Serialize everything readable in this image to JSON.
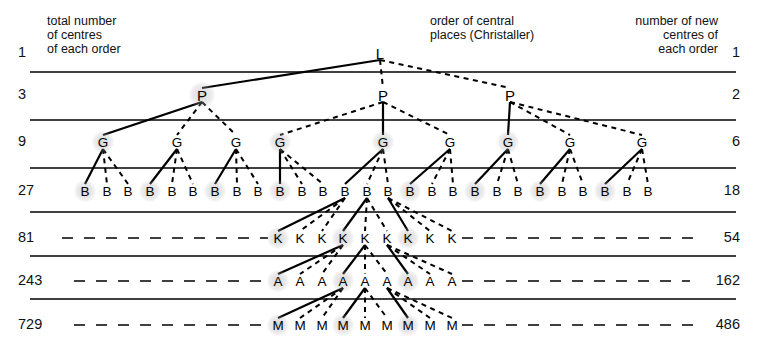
{
  "header": {
    "left_label": "total number\nof centres\nof each order",
    "mid_label": "order of central\nplaces (Christaller)",
    "right_label": "number of new\ncentres of\neach order"
  },
  "colors": {
    "ink": "#111111",
    "rule": "#000000",
    "halo": "#b0b0b0"
  },
  "rows": [
    {
      "symbol": "L",
      "total": "1",
      "new": "1",
      "y": 53,
      "rule_y": 72,
      "count": 1
    },
    {
      "symbol": "P",
      "total": "3",
      "new": "2",
      "y": 95,
      "rule_y": 120,
      "count": 3
    },
    {
      "symbol": "G",
      "total": "9",
      "new": "6",
      "y": 142,
      "rule_y": 168,
      "count": 9
    },
    {
      "symbol": "B",
      "total": "27",
      "new": "18",
      "y": 191,
      "rule_y": 212,
      "count": 27
    },
    {
      "symbol": "K",
      "total": "81",
      "new": "54",
      "y": 238,
      "rule_y": 256,
      "count": 81
    },
    {
      "symbol": "A",
      "total": "243",
      "new": "162",
      "y": 281,
      "rule_y": 299,
      "count": 243
    },
    {
      "symbol": "M",
      "total": "729",
      "new": "486",
      "y": 325,
      "rule_y": null,
      "count": 729
    }
  ],
  "nodes": {
    "L": [
      {
        "x": 380,
        "halo": false
      }
    ],
    "P": [
      {
        "x": 202,
        "halo": true
      },
      {
        "x": 383,
        "halo": false
      },
      {
        "x": 510,
        "halo": false
      }
    ],
    "G": [
      {
        "x": 103,
        "halo": true
      },
      {
        "x": 177,
        "halo": false
      },
      {
        "x": 236,
        "halo": false
      },
      {
        "x": 280,
        "halo": true
      },
      {
        "x": 383,
        "halo": true
      },
      {
        "x": 450,
        "halo": false
      },
      {
        "x": 508,
        "halo": true
      },
      {
        "x": 570,
        "halo": false
      },
      {
        "x": 642,
        "halo": false
      }
    ],
    "B": [
      {
        "x": 85,
        "halo": true
      },
      {
        "x": 107,
        "halo": false
      },
      {
        "x": 128,
        "halo": false
      },
      {
        "x": 150,
        "halo": true
      },
      {
        "x": 172,
        "halo": false
      },
      {
        "x": 193,
        "halo": false
      },
      {
        "x": 215,
        "halo": true
      },
      {
        "x": 237,
        "halo": false
      },
      {
        "x": 258,
        "halo": false
      },
      {
        "x": 280,
        "halo": true
      },
      {
        "x": 302,
        "halo": false
      },
      {
        "x": 323,
        "halo": false
      },
      {
        "x": 345,
        "halo": false
      },
      {
        "x": 367,
        "halo": false
      },
      {
        "x": 388,
        "halo": false
      },
      {
        "x": 410,
        "halo": true
      },
      {
        "x": 432,
        "halo": false
      },
      {
        "x": 453,
        "halo": false
      },
      {
        "x": 475,
        "halo": true
      },
      {
        "x": 497,
        "halo": false
      },
      {
        "x": 518,
        "halo": false
      },
      {
        "x": 540,
        "halo": true
      },
      {
        "x": 562,
        "halo": false
      },
      {
        "x": 583,
        "halo": false
      },
      {
        "x": 605,
        "halo": true
      },
      {
        "x": 627,
        "halo": false
      },
      {
        "x": 648,
        "halo": false
      }
    ],
    "K": [
      {
        "x": 278,
        "halo": true
      },
      {
        "x": 300,
        "halo": false
      },
      {
        "x": 322,
        "halo": false
      },
      {
        "x": 343,
        "halo": true
      },
      {
        "x": 365,
        "halo": false
      },
      {
        "x": 387,
        "halo": false
      },
      {
        "x": 408,
        "halo": true
      },
      {
        "x": 430,
        "halo": false
      },
      {
        "x": 452,
        "halo": false
      }
    ],
    "A": [
      {
        "x": 278,
        "halo": true
      },
      {
        "x": 300,
        "halo": false
      },
      {
        "x": 322,
        "halo": false
      },
      {
        "x": 343,
        "halo": true
      },
      {
        "x": 365,
        "halo": false
      },
      {
        "x": 387,
        "halo": false
      },
      {
        "x": 408,
        "halo": true
      },
      {
        "x": 430,
        "halo": false
      },
      {
        "x": 452,
        "halo": false
      }
    ],
    "M": [
      {
        "x": 278,
        "halo": true
      },
      {
        "x": 300,
        "halo": false
      },
      {
        "x": 322,
        "halo": false
      },
      {
        "x": 343,
        "halo": true
      },
      {
        "x": 365,
        "halo": false
      },
      {
        "x": 387,
        "halo": false
      },
      {
        "x": 408,
        "halo": true
      },
      {
        "x": 430,
        "halo": false
      },
      {
        "x": 452,
        "halo": false
      }
    ]
  },
  "links": [
    {
      "from": "L",
      "fi": 0,
      "to": "P",
      "ti": 0,
      "style": "solid"
    },
    {
      "from": "L",
      "fi": 0,
      "to": "P",
      "ti": 1,
      "style": "dashed"
    },
    {
      "from": "L",
      "fi": 0,
      "to": "P",
      "ti": 2,
      "style": "dashed"
    },
    {
      "from": "P",
      "fi": 0,
      "to": "G",
      "ti": 0,
      "style": "solid"
    },
    {
      "from": "P",
      "fi": 0,
      "to": "G",
      "ti": 1,
      "style": "dashed"
    },
    {
      "from": "P",
      "fi": 0,
      "to": "G",
      "ti": 2,
      "style": "dashed"
    },
    {
      "from": "P",
      "fi": 1,
      "to": "G",
      "ti": 3,
      "style": "dashed"
    },
    {
      "from": "P",
      "fi": 1,
      "to": "G",
      "ti": 4,
      "style": "solid"
    },
    {
      "from": "P",
      "fi": 1,
      "to": "G",
      "ti": 5,
      "style": "dashed"
    },
    {
      "from": "P",
      "fi": 2,
      "to": "G",
      "ti": 6,
      "style": "solid"
    },
    {
      "from": "P",
      "fi": 2,
      "to": "G",
      "ti": 7,
      "style": "dashed"
    },
    {
      "from": "P",
      "fi": 2,
      "to": "G",
      "ti": 8,
      "style": "dashed"
    },
    {
      "from": "G",
      "fi": 0,
      "to": "B",
      "ti": 0,
      "style": "solid"
    },
    {
      "from": "G",
      "fi": 0,
      "to": "B",
      "ti": 1,
      "style": "dashed"
    },
    {
      "from": "G",
      "fi": 0,
      "to": "B",
      "ti": 2,
      "style": "dashed"
    },
    {
      "from": "G",
      "fi": 1,
      "to": "B",
      "ti": 3,
      "style": "solid"
    },
    {
      "from": "G",
      "fi": 1,
      "to": "B",
      "ti": 4,
      "style": "dashed"
    },
    {
      "from": "G",
      "fi": 1,
      "to": "B",
      "ti": 5,
      "style": "dashed"
    },
    {
      "from": "G",
      "fi": 2,
      "to": "B",
      "ti": 6,
      "style": "solid"
    },
    {
      "from": "G",
      "fi": 2,
      "to": "B",
      "ti": 7,
      "style": "dashed"
    },
    {
      "from": "G",
      "fi": 2,
      "to": "B",
      "ti": 8,
      "style": "dashed"
    },
    {
      "from": "G",
      "fi": 3,
      "to": "B",
      "ti": 9,
      "style": "solid"
    },
    {
      "from": "G",
      "fi": 3,
      "to": "B",
      "ti": 10,
      "style": "dashed"
    },
    {
      "from": "G",
      "fi": 3,
      "to": "B",
      "ti": 11,
      "style": "dashed"
    },
    {
      "from": "G",
      "fi": 4,
      "to": "B",
      "ti": 12,
      "style": "solid"
    },
    {
      "from": "G",
      "fi": 4,
      "to": "B",
      "ti": 13,
      "style": "dashed"
    },
    {
      "from": "G",
      "fi": 4,
      "to": "B",
      "ti": 14,
      "style": "dashed"
    },
    {
      "from": "G",
      "fi": 5,
      "to": "B",
      "ti": 15,
      "style": "solid"
    },
    {
      "from": "G",
      "fi": 5,
      "to": "B",
      "ti": 16,
      "style": "dashed"
    },
    {
      "from": "G",
      "fi": 5,
      "to": "B",
      "ti": 17,
      "style": "dashed"
    },
    {
      "from": "G",
      "fi": 6,
      "to": "B",
      "ti": 18,
      "style": "solid"
    },
    {
      "from": "G",
      "fi": 6,
      "to": "B",
      "ti": 19,
      "style": "dashed"
    },
    {
      "from": "G",
      "fi": 6,
      "to": "B",
      "ti": 20,
      "style": "dashed"
    },
    {
      "from": "G",
      "fi": 7,
      "to": "B",
      "ti": 21,
      "style": "solid"
    },
    {
      "from": "G",
      "fi": 7,
      "to": "B",
      "ti": 22,
      "style": "dashed"
    },
    {
      "from": "G",
      "fi": 7,
      "to": "B",
      "ti": 23,
      "style": "dashed"
    },
    {
      "from": "G",
      "fi": 8,
      "to": "B",
      "ti": 24,
      "style": "solid"
    },
    {
      "from": "G",
      "fi": 8,
      "to": "B",
      "ti": 25,
      "style": "dashed"
    },
    {
      "from": "G",
      "fi": 8,
      "to": "B",
      "ti": 26,
      "style": "dashed"
    },
    {
      "from": "B",
      "fi": 12,
      "to": "K",
      "ti": 0,
      "style": "solid"
    },
    {
      "from": "B",
      "fi": 12,
      "to": "K",
      "ti": 1,
      "style": "dashed"
    },
    {
      "from": "B",
      "fi": 12,
      "to": "K",
      "ti": 2,
      "style": "dashed"
    },
    {
      "from": "B",
      "fi": 13,
      "to": "K",
      "ti": 3,
      "style": "solid"
    },
    {
      "from": "B",
      "fi": 13,
      "to": "K",
      "ti": 4,
      "style": "dashed"
    },
    {
      "from": "B",
      "fi": 13,
      "to": "K",
      "ti": 5,
      "style": "dashed"
    },
    {
      "from": "B",
      "fi": 14,
      "to": "K",
      "ti": 6,
      "style": "solid"
    },
    {
      "from": "B",
      "fi": 14,
      "to": "K",
      "ti": 7,
      "style": "dashed"
    },
    {
      "from": "B",
      "fi": 14,
      "to": "K",
      "ti": 8,
      "style": "dashed"
    },
    {
      "from": "K",
      "fi": 3,
      "to": "A",
      "ti": 0,
      "style": "solid"
    },
    {
      "from": "K",
      "fi": 3,
      "to": "A",
      "ti": 1,
      "style": "dashed"
    },
    {
      "from": "K",
      "fi": 3,
      "to": "A",
      "ti": 2,
      "style": "dashed"
    },
    {
      "from": "K",
      "fi": 4,
      "to": "A",
      "ti": 3,
      "style": "solid"
    },
    {
      "from": "K",
      "fi": 4,
      "to": "A",
      "ti": 4,
      "style": "dashed"
    },
    {
      "from": "K",
      "fi": 4,
      "to": "A",
      "ti": 5,
      "style": "dashed"
    },
    {
      "from": "K",
      "fi": 5,
      "to": "A",
      "ti": 6,
      "style": "solid"
    },
    {
      "from": "K",
      "fi": 5,
      "to": "A",
      "ti": 7,
      "style": "dashed"
    },
    {
      "from": "K",
      "fi": 5,
      "to": "A",
      "ti": 8,
      "style": "dashed"
    },
    {
      "from": "A",
      "fi": 3,
      "to": "M",
      "ti": 0,
      "style": "solid"
    },
    {
      "from": "A",
      "fi": 3,
      "to": "M",
      "ti": 1,
      "style": "dashed"
    },
    {
      "from": "A",
      "fi": 3,
      "to": "M",
      "ti": 2,
      "style": "dashed"
    },
    {
      "from": "A",
      "fi": 4,
      "to": "M",
      "ti": 3,
      "style": "solid"
    },
    {
      "from": "A",
      "fi": 4,
      "to": "M",
      "ti": 4,
      "style": "dashed"
    },
    {
      "from": "A",
      "fi": 4,
      "to": "M",
      "ti": 5,
      "style": "dashed"
    },
    {
      "from": "A",
      "fi": 5,
      "to": "M",
      "ti": 6,
      "style": "solid"
    },
    {
      "from": "A",
      "fi": 5,
      "to": "M",
      "ti": 7,
      "style": "dashed"
    },
    {
      "from": "A",
      "fi": 5,
      "to": "M",
      "ti": 8,
      "style": "dashed"
    }
  ],
  "leader_dashes": [
    {
      "row": "K",
      "x1": 62,
      "x2": 268,
      "y": 238
    },
    {
      "row": "K",
      "x1": 462,
      "x2": 700,
      "y": 238
    },
    {
      "row": "A",
      "x1": 74,
      "x2": 268,
      "y": 281
    },
    {
      "row": "A",
      "x1": 462,
      "x2": 690,
      "y": 281
    },
    {
      "row": "M",
      "x1": 74,
      "x2": 268,
      "y": 325
    },
    {
      "row": "M",
      "x1": 462,
      "x2": 700,
      "y": 325
    }
  ],
  "rules": [
    {
      "x1": 30,
      "x2": 736,
      "y": 72
    },
    {
      "x1": 30,
      "x2": 736,
      "y": 120
    },
    {
      "x1": 30,
      "x2": 736,
      "y": 168
    },
    {
      "x1": 30,
      "x2": 736,
      "y": 212
    },
    {
      "x1": 30,
      "x2": 736,
      "y": 256
    },
    {
      "x1": 30,
      "x2": 736,
      "y": 299
    }
  ]
}
